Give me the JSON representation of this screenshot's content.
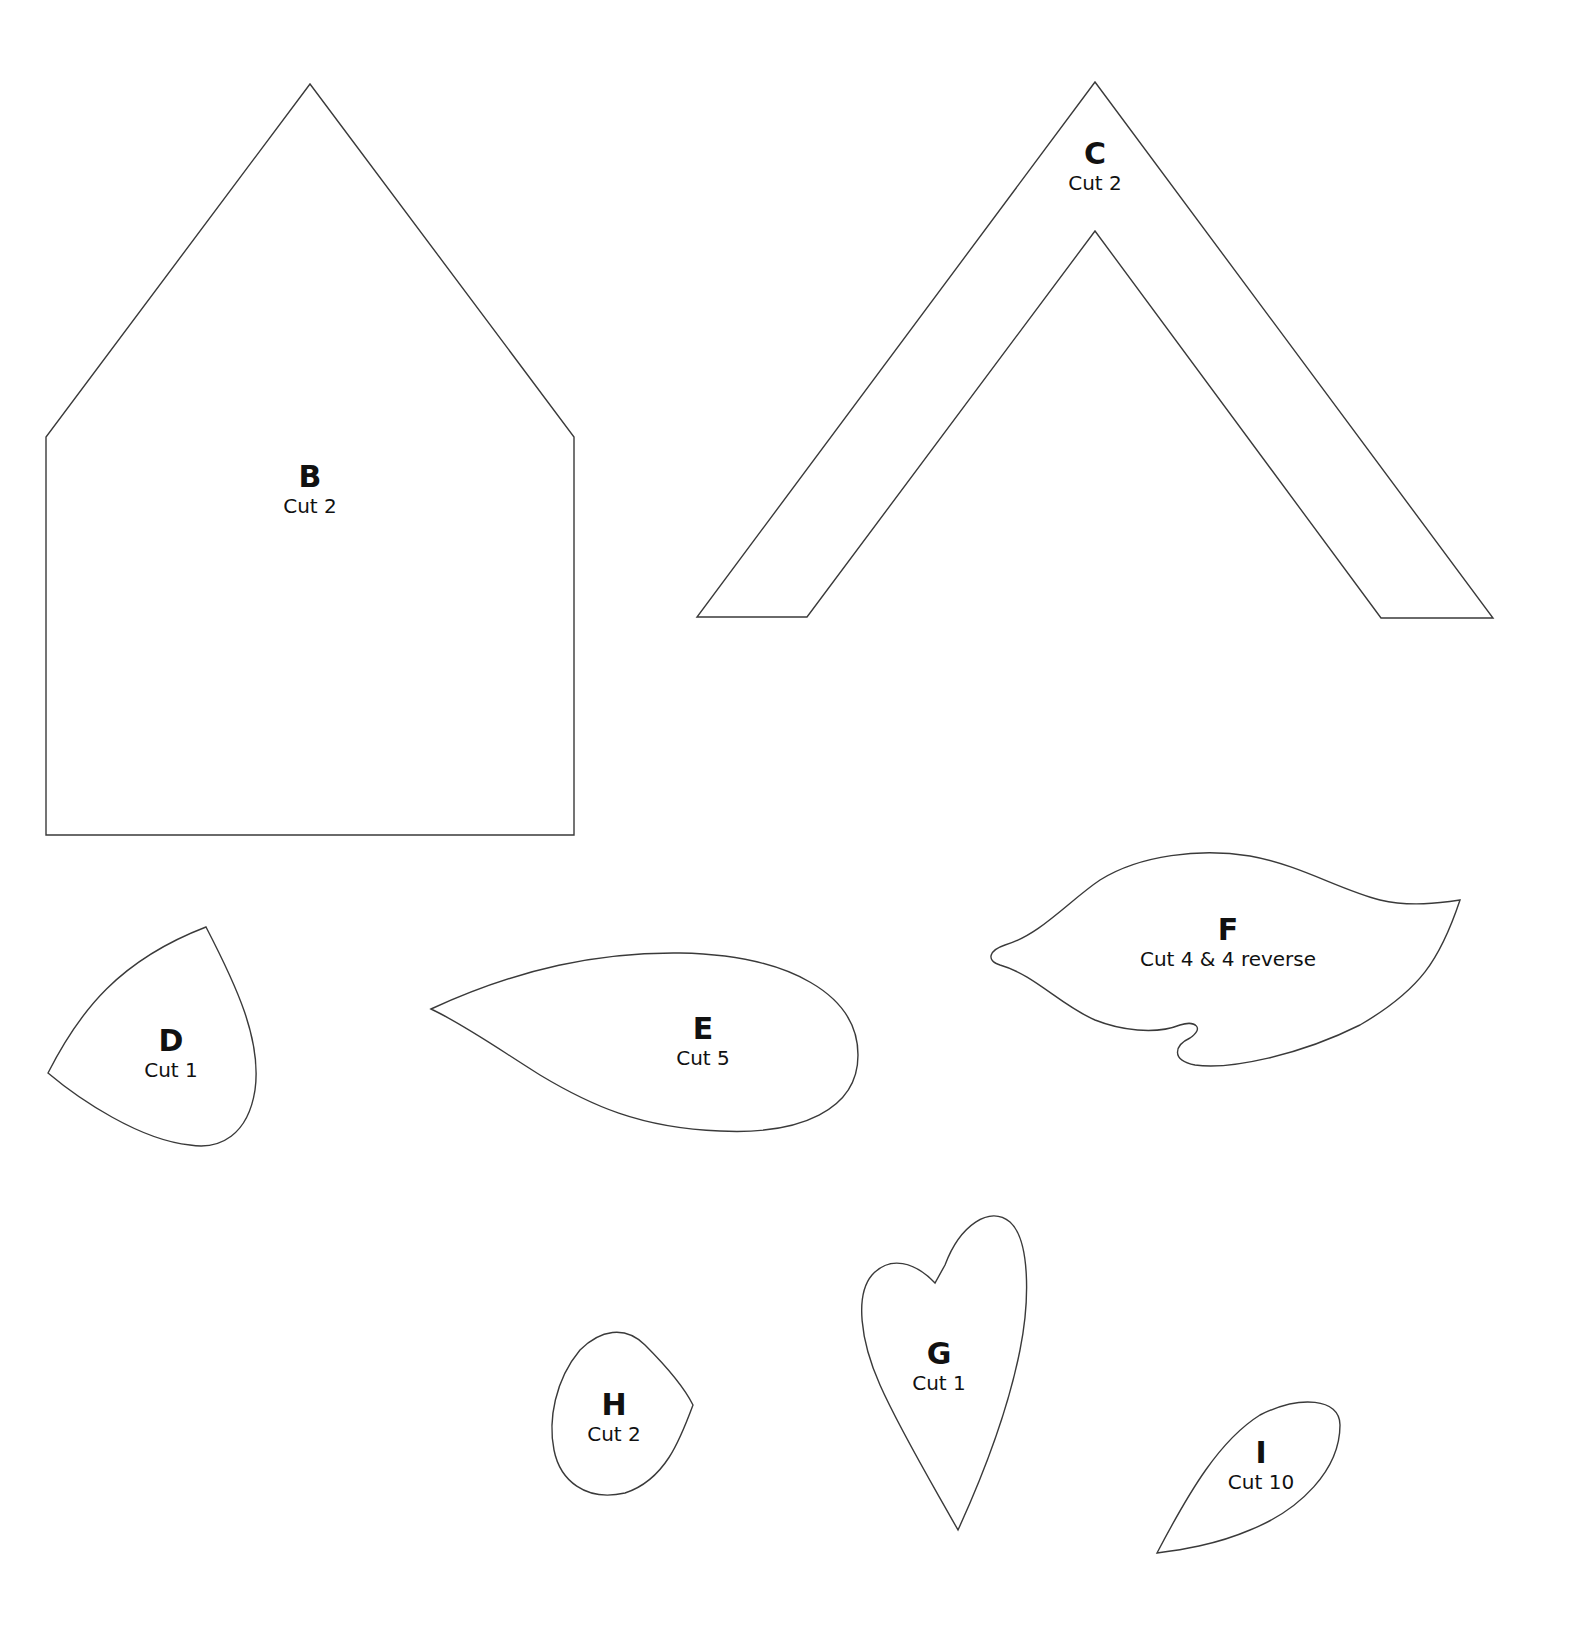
{
  "page": {
    "background": "#ffffff",
    "line_color": "#3a3a3a"
  },
  "pieces": [
    {
      "id": "B",
      "letter": "B",
      "instruction": "Cut 2"
    },
    {
      "id": "C",
      "letter": "C",
      "instruction": "Cut 2"
    },
    {
      "id": "D",
      "letter": "D",
      "instruction": "Cut 1"
    },
    {
      "id": "E",
      "letter": "E",
      "instruction": "Cut 5"
    },
    {
      "id": "F",
      "letter": "F",
      "instruction": "Cut 4 & 4 reverse"
    },
    {
      "id": "G",
      "letter": "G",
      "instruction": "Cut 1"
    },
    {
      "id": "H",
      "letter": "H",
      "instruction": "Cut 2"
    },
    {
      "id": "I",
      "letter": "I",
      "instruction": "Cut 10"
    }
  ]
}
